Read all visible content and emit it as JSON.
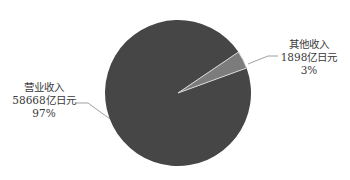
{
  "chart_data": {
    "type": "pie",
    "title": "",
    "categories": [
      "营业收入",
      "其他收入"
    ],
    "values": [
      58668,
      1898
    ],
    "unit": "亿日元",
    "percent_labels": [
      "97%",
      "3%"
    ],
    "series": [
      {
        "name": "营业收入",
        "value": 58668,
        "value_label": "58668亿日元",
        "percent": "97%",
        "color": "#464646"
      },
      {
        "name": "其他收入",
        "value": 1898,
        "value_label": "1898亿日元",
        "percent": "3%",
        "color": "#7c7c7c"
      }
    ],
    "legend": "none",
    "labels_position": "outside with leader lines"
  },
  "labels": {
    "operating": {
      "name": "营业收入",
      "value": "58668亿日元",
      "pct": "97%"
    },
    "other": {
      "name": "其他收入",
      "value": "1898亿日元",
      "pct": "3%"
    }
  }
}
